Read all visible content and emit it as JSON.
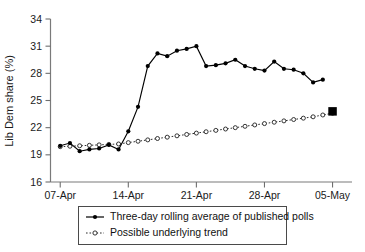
{
  "chart_data": {
    "type": "line",
    "title": "",
    "xlabel": "",
    "ylabel": "Lib Dem share (%)",
    "ylim": [
      16,
      34
    ],
    "yticks": [
      16,
      19,
      22,
      25,
      28,
      31,
      34
    ],
    "xticks": [
      "07-Apr",
      "14-Apr",
      "21-Apr",
      "28-Apr",
      "05-May"
    ],
    "xtick_days": [
      0,
      7,
      14,
      21,
      28
    ],
    "xlim_days": [
      -1,
      30
    ],
    "grid": false,
    "legend_position": "below",
    "series": [
      {
        "name": "Three-day rolling average of published polls",
        "style": "solid-filled-circles",
        "x_days": [
          0,
          1,
          2,
          3,
          4,
          5,
          6,
          7,
          8,
          9,
          10,
          11,
          12,
          13,
          14,
          15,
          16,
          17,
          18,
          19,
          20,
          21,
          22,
          23,
          24,
          25,
          26,
          27
        ],
        "values": [
          20.0,
          20.3,
          19.4,
          19.6,
          19.7,
          20.1,
          19.6,
          21.6,
          24.3,
          28.8,
          30.2,
          29.9,
          30.5,
          30.7,
          31.0,
          28.8,
          28.9,
          29.1,
          29.5,
          28.8,
          28.5,
          28.3,
          29.3,
          28.5,
          28.4,
          28.0,
          27.0,
          27.3
        ]
      },
      {
        "name": "Possible underlying trend",
        "style": "dotted-open-circles",
        "x_days": [
          0,
          1,
          2,
          3,
          4,
          5,
          6,
          7,
          8,
          9,
          10,
          11,
          12,
          13,
          14,
          15,
          16,
          17,
          18,
          19,
          20,
          21,
          22,
          23,
          24,
          25,
          26,
          27,
          28
        ],
        "values": [
          19.9,
          19.95,
          20.0,
          20.05,
          20.1,
          20.15,
          20.2,
          20.35,
          20.5,
          20.65,
          20.8,
          20.95,
          21.1,
          21.25,
          21.4,
          21.55,
          21.7,
          21.85,
          22.0,
          22.15,
          22.3,
          22.45,
          22.6,
          22.75,
          22.9,
          23.05,
          23.2,
          23.4,
          23.6
        ]
      }
    ],
    "annotations": [
      {
        "name": "election-result-marker",
        "marker": "filled-square",
        "x_day": 28,
        "value": 23.8
      }
    ]
  },
  "legend": {
    "entries": [
      {
        "label": "Three-day rolling average of published polls",
        "style": "solid-filled-circle"
      },
      {
        "label": "Possible underlying trend",
        "style": "dotted-open-circle"
      }
    ]
  },
  "colors": {
    "series_primary": "#000000",
    "series_trend": "#2b2b2b",
    "axis": "#7a7a7a",
    "text": "#1a1a1a",
    "background": "#ffffff"
  }
}
